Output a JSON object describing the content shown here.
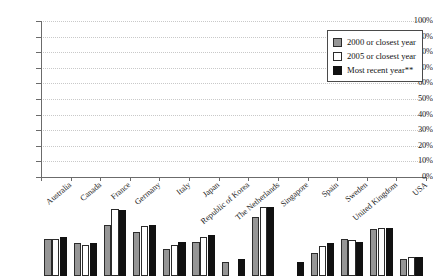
{
  "chart_data": {
    "type": "bar",
    "title": "",
    "subtitle": "",
    "xlabel": "",
    "ylabel": "",
    "ylim": [
      0,
      100
    ],
    "grid": true,
    "legend_position": "top-right",
    "ytick_labels": [
      "100%",
      "90%",
      "80%",
      "70%",
      "60%",
      "50%",
      "40%",
      "30%",
      "20%",
      "10%",
      "0%"
    ],
    "ytick_values": [
      100,
      90,
      80,
      70,
      60,
      50,
      40,
      30,
      20,
      10,
      0
    ],
    "categories": [
      "Australia",
      "Canada",
      "France",
      "Germany",
      "Italy",
      "Japan",
      "Republic of Korea",
      "The Netherlands",
      "Singapore",
      "Spain",
      "Sweden",
      "United Kingdom",
      "USA"
    ],
    "series": [
      {
        "name": "2000 or closest year",
        "color": "#969696",
        "values": [
          24,
          21,
          33,
          28,
          17,
          22,
          9,
          38,
          null,
          15,
          24,
          30,
          11
        ]
      },
      {
        "name": "2005 or closest year",
        "color": "#ffffff",
        "values": [
          24,
          20,
          43,
          32,
          20,
          25,
          null,
          44,
          null,
          19,
          23,
          31,
          12
        ]
      },
      {
        "name": "Most recent year**",
        "color": "#111111",
        "values": [
          25,
          21,
          42,
          33,
          22,
          26,
          11,
          44,
          9,
          21,
          22,
          31,
          12
        ]
      }
    ]
  }
}
